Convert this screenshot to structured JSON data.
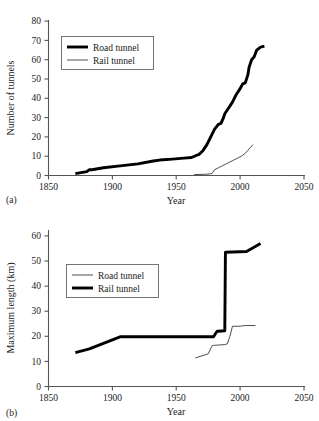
{
  "figure": {
    "panel_a_label": "(a)",
    "panel_b_label": "(b)"
  },
  "chart_data": [
    {
      "id": "panel-a",
      "type": "line",
      "title": "",
      "xlabel": "Year",
      "ylabel": "Number of tunnels",
      "xlim": [
        1850,
        2050
      ],
      "ylim": [
        0,
        80
      ],
      "xticks": [
        1850,
        1900,
        1950,
        2000,
        2050
      ],
      "yticks": [
        0,
        10,
        20,
        30,
        40,
        50,
        60,
        70,
        80
      ],
      "grid": false,
      "legend_position": "upper-left",
      "legend": [
        "Road tunnel",
        "Rail tunnel"
      ],
      "series": [
        {
          "name": "Road tunnel",
          "style": "thick",
          "x": [
            1871,
            1880,
            1882,
            1884,
            1893,
            1906,
            1920,
            1932,
            1937,
            1947,
            1956,
            1962,
            1966,
            1968,
            1971,
            1974,
            1977,
            1980,
            1983,
            1985,
            1987,
            1988,
            1991,
            1994,
            1997,
            2000,
            2002,
            2004,
            2006,
            2007,
            2009,
            2011,
            2013,
            2016,
            2019
          ],
          "y": [
            1,
            2,
            3,
            3,
            4,
            5,
            6,
            7.5,
            8,
            8.5,
            9,
            9.3,
            10.5,
            11,
            13,
            16,
            20,
            24,
            26.5,
            27,
            30,
            32,
            35,
            38,
            42,
            45,
            47.5,
            48,
            52,
            56,
            60,
            61.5,
            65,
            66.5,
            67
          ]
        },
        {
          "name": "Rail tunnel",
          "style": "thin",
          "x": [
            1964,
            1972,
            1976,
            1978,
            1980,
            1983,
            1986,
            1989,
            1992,
            1995,
            1998,
            2001,
            2004,
            2006,
            2008,
            2010
          ],
          "y": [
            0.5,
            0.6,
            0.8,
            1,
            3,
            4,
            5,
            6,
            7,
            8,
            9,
            10,
            11.5,
            13,
            14.5,
            16
          ]
        }
      ]
    },
    {
      "id": "panel-b",
      "type": "line",
      "title": "",
      "xlabel": "Year",
      "ylabel": "Maximum length (km)",
      "xlim": [
        1850,
        2050
      ],
      "ylim": [
        0,
        60
      ],
      "xticks": [
        1850,
        1900,
        1950,
        2000,
        2050
      ],
      "yticks": [
        0,
        10,
        20,
        30,
        40,
        50,
        60
      ],
      "grid": false,
      "legend_position": "upper-left",
      "legend": [
        "Road tunnel",
        "Rail tunnel"
      ],
      "series": [
        {
          "name": "Rail tunnel",
          "style": "thick",
          "x": [
            1871,
            1882,
            1906,
            1975,
            1979,
            1980,
            1982,
            1983,
            1988,
            1988.5,
            2005,
            2016
          ],
          "y": [
            13.5,
            15,
            19.8,
            19.8,
            19.8,
            20.5,
            22,
            22,
            22.2,
            53.5,
            53.8,
            57
          ]
        },
        {
          "name": "Road tunnel",
          "style": "thin",
          "x": [
            1965,
            1975,
            1978,
            1979,
            1980,
            1988,
            1990,
            1992,
            1994,
            2000,
            2002,
            2005,
            2012
          ],
          "y": [
            11.4,
            13,
            16.2,
            16.4,
            16.4,
            16.7,
            17,
            20,
            24,
            24,
            24.2,
            24.3,
            24.3
          ]
        }
      ]
    }
  ]
}
